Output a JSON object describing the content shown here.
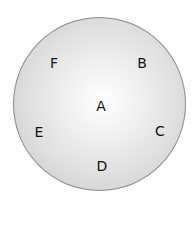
{
  "diagram": {
    "shape": "circle",
    "fill_colors": {
      "center": "#ffffff",
      "edge": "#c4c4c4",
      "border": "#8a8a8a"
    },
    "labels": [
      {
        "id": "A",
        "text": "A",
        "x": 101,
        "y": 106
      },
      {
        "id": "B",
        "text": "B",
        "x": 142,
        "y": 63
      },
      {
        "id": "C",
        "text": "C",
        "x": 160,
        "y": 131
      },
      {
        "id": "D",
        "text": "D",
        "x": 102,
        "y": 166
      },
      {
        "id": "E",
        "text": "E",
        "x": 39,
        "y": 132
      },
      {
        "id": "F",
        "text": "F",
        "x": 54,
        "y": 63
      }
    ]
  }
}
